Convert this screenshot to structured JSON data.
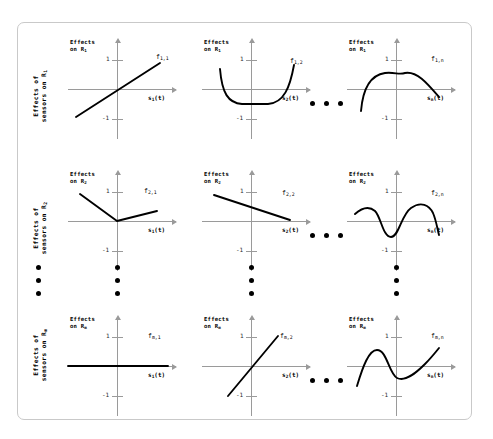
{
  "figure": {
    "rows": [
      {
        "id": "row-1",
        "side_label_line1": "Effects of",
        "side_label_line2": "sensors on R",
        "side_label_sub": "1",
        "y_caption_line1": "Effects",
        "y_caption_line2": "on R",
        "y_caption_sub": "1",
        "tick_pos": "1",
        "tick_neg": "-1"
      },
      {
        "id": "row-2",
        "side_label_line1": "Effects of",
        "side_label_line2": "sensors on R",
        "side_label_sub": "2",
        "y_caption_line1": "Effects",
        "y_caption_line2": "on R",
        "y_caption_sub": "2",
        "tick_pos": "1",
        "tick_neg": "-1"
      },
      {
        "id": "row-m",
        "side_label_line1": "Effects of",
        "side_label_line2": "sensors on R",
        "side_label_sub": "m",
        "y_caption_line1": "Effects",
        "y_caption_line2": "on R",
        "y_caption_sub": "m",
        "tick_pos": "1",
        "tick_neg": "-1"
      }
    ],
    "columns": [
      {
        "id": "col-1",
        "x_caption": "s",
        "x_caption_sub": "1",
        "x_caption_tail": "(t)"
      },
      {
        "id": "col-2",
        "x_caption": "s",
        "x_caption_sub": "2",
        "x_caption_tail": "(t)"
      },
      {
        "id": "col-n",
        "x_caption": "s",
        "x_caption_sub": "n",
        "x_caption_tail": "(t)"
      }
    ],
    "cells": [
      {
        "id": "cell-1-1",
        "fname": "f",
        "fsub": "1,1",
        "shape": "increasing-line",
        "description": "monotonically increasing straight line crossing near origin"
      },
      {
        "id": "cell-1-2",
        "fname": "f",
        "fsub": "1,2",
        "shape": "u-curve",
        "description": "flat-bottomed U shaped curve, both ends rising"
      },
      {
        "id": "cell-1-n",
        "fname": "f",
        "fsub": "1,n",
        "shape": "hump",
        "description": "single broad hump peaking just left of the y-axis, falling at both ends"
      },
      {
        "id": "cell-2-1",
        "fname": "f",
        "fsub": "2,1",
        "shape": "v-kink",
        "description": "steep descending segment meeting origin then a shallow rising segment"
      },
      {
        "id": "cell-2-2",
        "fname": "f",
        "fsub": "2,2",
        "shape": "decreasing-line",
        "description": "monotonically decreasing straight line"
      },
      {
        "id": "cell-2-n",
        "fname": "f",
        "fsub": "2,n",
        "shape": "oscillation",
        "description": "oscillating wave with a trough then a tall crest then a sharp drop"
      },
      {
        "id": "cell-m-1",
        "fname": "f",
        "fsub": "m,1",
        "shape": "zero-line",
        "description": "flat line lying exactly on the horizontal axis (no effect)"
      },
      {
        "id": "cell-m-2",
        "fname": "f",
        "fsub": "m,2",
        "shape": "steep-increasing-line",
        "description": "steeply increasing straight line through the origin"
      },
      {
        "id": "cell-m-n",
        "fname": "f",
        "fsub": "m,n",
        "shape": "cubic-wave",
        "description": "S shaped cubic-like wave, crest on the left, trough at centre, rising right"
      }
    ],
    "ellipsis": {
      "horizontal_dot_count": 3,
      "vertical_dot_count": 3
    },
    "colors": {
      "curve": "#000000",
      "axis": "#9a9a9a",
      "border": "#c9c9c9",
      "background": "#ffffff"
    }
  }
}
